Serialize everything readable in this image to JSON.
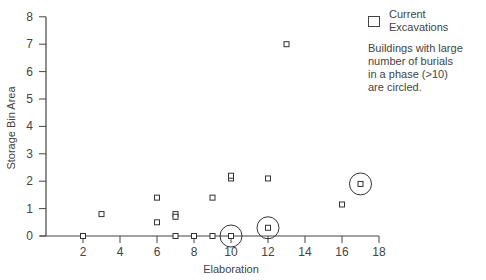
{
  "chart_data": {
    "type": "scatter",
    "title": "",
    "xlabel": "Elaboration",
    "ylabel": "Storage Bin Area",
    "xlim": [
      0,
      18
    ],
    "ylim": [
      0,
      8
    ],
    "x_ticks": [
      2,
      4,
      6,
      8,
      10,
      12,
      14,
      16,
      18
    ],
    "y_ticks": [
      0,
      1,
      2,
      3,
      4,
      5,
      6,
      7,
      8
    ],
    "grid": false,
    "legend_position": "top-right",
    "series": [
      {
        "name": "Current Excavations",
        "marker": "open-square",
        "points": [
          {
            "x": 2,
            "y": 0,
            "circled": false
          },
          {
            "x": 3,
            "y": 0.8,
            "circled": false
          },
          {
            "x": 6,
            "y": 1.4,
            "circled": false
          },
          {
            "x": 6,
            "y": 0.5,
            "circled": false
          },
          {
            "x": 7,
            "y": 0.8,
            "circled": false
          },
          {
            "x": 7,
            "y": 0.7,
            "circled": false
          },
          {
            "x": 7,
            "y": 0,
            "circled": false
          },
          {
            "x": 8,
            "y": 0,
            "circled": false
          },
          {
            "x": 9,
            "y": 0,
            "circled": false
          },
          {
            "x": 9,
            "y": 1.4,
            "circled": false
          },
          {
            "x": 10,
            "y": 0,
            "circled": true
          },
          {
            "x": 10,
            "y": 2.1,
            "circled": false
          },
          {
            "x": 10,
            "y": 2.2,
            "circled": false
          },
          {
            "x": 12,
            "y": 2.1,
            "circled": false
          },
          {
            "x": 12,
            "y": 0.3,
            "circled": true
          },
          {
            "x": 13,
            "y": 7.0,
            "circled": false
          },
          {
            "x": 16,
            "y": 1.15,
            "circled": false
          },
          {
            "x": 17,
            "y": 1.9,
            "circled": true
          }
        ]
      }
    ],
    "annotations": [
      "Buildings with large number of burials in a phase (>10) are circled."
    ]
  },
  "legend": {
    "series_label": "Current Excavations",
    "note_lines": [
      "Buildings with large",
      "number of burials",
      "in a phase (>10)",
      "are circled."
    ]
  },
  "axes": {
    "x_label": "Elaboration",
    "y_label": "Storage Bin Area"
  }
}
